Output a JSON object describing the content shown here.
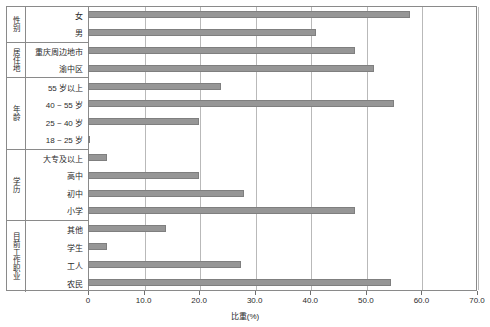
{
  "chart_data": {
    "type": "bar",
    "orientation": "horizontal",
    "title": "",
    "xlabel": "比重(%)",
    "ylabel": "",
    "xlim": [
      0,
      70
    ],
    "xticks": [
      0,
      10,
      20,
      30,
      40,
      50,
      60,
      70
    ],
    "xtick_labels": [
      "0",
      "10.0",
      "20.0",
      "30.0",
      "40.0",
      "50.0",
      "60.0",
      "70.0"
    ],
    "grid": true,
    "legend": "none",
    "bar_color": "#969696",
    "bar_edge_color": "#7f7f7f",
    "frame_color": "#8a8a8a",
    "gridline_color": "#b9b9b9",
    "categories": [
      "女",
      "男",
      "重庆周边地市",
      "渝中区",
      "55 岁以上",
      "40 ~ 55 岁",
      "25 ~ 40 岁",
      "18 ~ 25 岁",
      "大专及以上",
      "高中",
      "初中",
      "小学",
      "其他",
      "学生",
      "工人",
      "农民"
    ],
    "values": [
      58.0,
      41.0,
      48.0,
      51.5,
      24.0,
      55.0,
      20.0,
      0.3,
      3.5,
      20.0,
      28.0,
      48.0,
      14.0,
      3.5,
      27.5,
      54.5
    ],
    "groups": [
      {
        "name": "性别",
        "rows": [
          {
            "label": "女",
            "value": 58.0
          },
          {
            "label": "男",
            "value": 41.0
          }
        ]
      },
      {
        "name": "居住地",
        "rows": [
          {
            "label": "重庆周边地市",
            "value": 48.0
          },
          {
            "label": "渝中区",
            "value": 51.5
          }
        ]
      },
      {
        "name": "年龄",
        "rows": [
          {
            "label": "55 岁以上",
            "value": 24.0
          },
          {
            "label": "40 ~ 55 岁",
            "value": 55.0
          },
          {
            "label": "25 ~ 40 岁",
            "value": 20.0
          },
          {
            "label": "18 ~ 25 岁",
            "value": 0.3
          }
        ]
      },
      {
        "name": "学历",
        "rows": [
          {
            "label": "大专及以上",
            "value": 3.5
          },
          {
            "label": "高中",
            "value": 20.0
          },
          {
            "label": "初中",
            "value": 28.0
          },
          {
            "label": "小学",
            "value": 48.0
          }
        ]
      },
      {
        "name": "目前工作职业",
        "rows": [
          {
            "label": "其他",
            "value": 14.0
          },
          {
            "label": "学生",
            "value": 3.5
          },
          {
            "label": "工人",
            "value": 27.5
          },
          {
            "label": "农民",
            "value": 54.5
          }
        ]
      }
    ]
  }
}
